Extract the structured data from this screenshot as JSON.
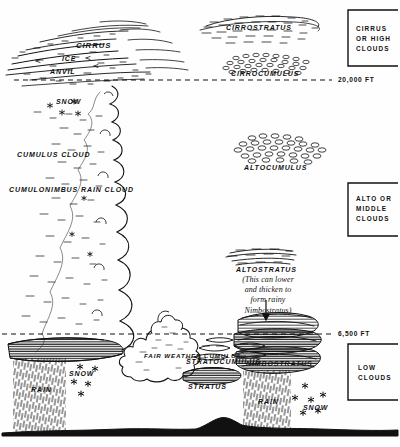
{
  "figure": {
    "kind": "cloud-types-altitude-diagram",
    "ink_color": "#111111",
    "paper_color": "#fefefe"
  },
  "altitude_lines": [
    {
      "id": "high",
      "label": "20,000 FT",
      "y": 80
    },
    {
      "id": "low",
      "label": "6,500 FT",
      "y": 334
    }
  ],
  "brackets": [
    {
      "id": "cirrus-high",
      "label": "CIRRUS\nOR HIGH\nCLOUDS"
    },
    {
      "id": "alto-middle",
      "label": "ALTO OR\nMIDDLE\nCLOUDS"
    },
    {
      "id": "low",
      "label": "LOW\nCLOUDS"
    }
  ],
  "cloud_labels": {
    "cirrus": "CIRRUS",
    "ice": "ICE",
    "anvil": "ANVIL",
    "cirrostratus": "CIRROSTRATUS",
    "cirrocumulus": "CIRROCUMULUS",
    "snow_upper": "SNOW",
    "cumulus_cloud": "CUMULUS CLOUD",
    "cumulonimbus": "CUMULONIMBUS\nRAIN CLOUD",
    "altocumulus": "ALTOCUMULUS",
    "altostratus": "ALTOSTRATUS",
    "stratocumulus": "STRATOCUMULUS",
    "stratus": "STRATUS",
    "nimbostratus": "NIMBOSTRATUS",
    "fair_weather_cumulus": "FAIR\nWEATHER\nCUMULUS",
    "rain_left": "RAIN",
    "snow_left": "SNOW",
    "rain_right": "RAIN",
    "snow_right": "SNOW"
  },
  "annotations": {
    "altostratus_note": "(This can lower\nand thicken to\nform rainy\nNimbostratus)"
  }
}
